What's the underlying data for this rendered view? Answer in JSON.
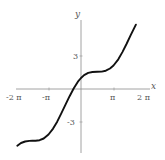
{
  "chart_data": {
    "type": "line",
    "title": "",
    "function": "y = x + cos(x)",
    "xlabel": "x",
    "ylabel": "y",
    "xlim": [
      -6.28,
      6.28
    ],
    "ylim": [
      -6,
      7
    ],
    "grid": false,
    "legend": null,
    "x_ticks": [
      {
        "value": -6.2832,
        "label": "-2 π"
      },
      {
        "value": -3.1416,
        "label": "-π"
      },
      {
        "value": 3.1416,
        "label": "π"
      },
      {
        "value": 6.2832,
        "label": "2 π"
      }
    ],
    "y_ticks": [
      {
        "value": 3,
        "label": "3"
      },
      {
        "value": -3,
        "label": "-3"
      }
    ],
    "series": [
      {
        "name": "y = x + cos(x)",
        "color": "#111111",
        "x": [
          -6.15,
          -5.8,
          -5.4,
          -5.0,
          -4.71,
          -4.4,
          -4.0,
          -3.6,
          -3.14,
          -2.7,
          -2.3,
          -1.9,
          -1.5,
          -1.1,
          -0.7,
          -0.3,
          0.0,
          0.3,
          0.7,
          1.1,
          1.57,
          2.0,
          2.4,
          2.8,
          3.14,
          3.6,
          4.0,
          4.4,
          4.8,
          5.3
        ],
        "y": [
          -5.16,
          -4.91,
          -4.77,
          -4.72,
          -4.71,
          -4.71,
          -4.65,
          -4.5,
          -4.14,
          -3.6,
          -2.97,
          -2.22,
          -1.43,
          -0.65,
          0.06,
          0.66,
          1.0,
          1.26,
          1.46,
          1.55,
          1.57,
          1.58,
          1.66,
          1.86,
          2.14,
          2.7,
          3.35,
          4.09,
          4.89,
          5.85
        ]
      }
    ]
  },
  "axes": {
    "x_label": "x",
    "y_label": "y",
    "tick_labels": {
      "xneg2pi": "-2 π",
      "xnegpi": "-π",
      "xpi": "π",
      "x2pi": "2 π",
      "y3": "3",
      "yneg3": "-3"
    }
  }
}
